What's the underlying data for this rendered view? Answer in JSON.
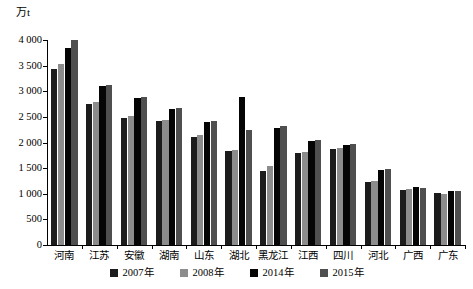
{
  "axis": {
    "unit_label": "万t",
    "y_ticks": [
      "0",
      "500",
      "1 000",
      "1 500",
      "2 000",
      "2 500",
      "3 000",
      "3 500",
      "4 000"
    ],
    "y_min": 0,
    "y_max": 4000
  },
  "legend": {
    "items": [
      {
        "label": "2007年",
        "color": "#1c1c1c"
      },
      {
        "label": "2008年",
        "color": "#8c8c8c"
      },
      {
        "label": "2014年",
        "color": "#050505"
      },
      {
        "label": "2015年",
        "color": "#4f4f4f"
      }
    ]
  },
  "chart_data": {
    "type": "bar",
    "title": "",
    "xlabel": "",
    "ylabel": "万t",
    "ylim": [
      0,
      4000
    ],
    "grid": false,
    "legend_position": "bottom",
    "categories": [
      "河南",
      "江苏",
      "安徽",
      "湖南",
      "山东",
      "湖北",
      "黑龙江",
      "江西",
      "四川",
      "河北",
      "广西",
      "广东"
    ],
    "series": [
      {
        "name": "2007年",
        "color": "#1c1c1c",
        "values": [
          3430,
          2760,
          2480,
          2420,
          2110,
          1830,
          1450,
          1800,
          1880,
          1230,
          1080,
          1020
        ]
      },
      {
        "name": "2008年",
        "color": "#8c8c8c",
        "values": [
          3530,
          2790,
          2520,
          2440,
          2140,
          1850,
          1550,
          1820,
          1900,
          1250,
          1090,
          1000
        ]
      },
      {
        "name": "2014年",
        "color": "#050505",
        "values": [
          3850,
          3100,
          2860,
          2650,
          2400,
          2880,
          2290,
          2020,
          1950,
          1460,
          1130,
          1060
        ]
      },
      {
        "name": "2015年",
        "color": "#4f4f4f",
        "values": [
          4010,
          3130,
          2890,
          2680,
          2420,
          2240,
          2320,
          2040,
          1970,
          1480,
          1120,
          1050
        ]
      }
    ]
  }
}
